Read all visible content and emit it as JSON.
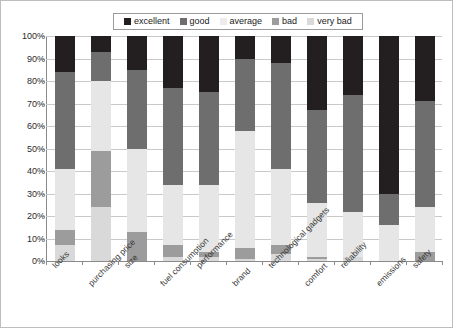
{
  "chart_data": {
    "type": "bar",
    "subtype": "stacked-bar-100-percent",
    "title": "",
    "xlabel": "",
    "ylabel": "",
    "ylim": [
      0,
      100
    ],
    "ytick_labels": [
      "0%",
      "10%",
      "20%",
      "30%",
      "40%",
      "50%",
      "60%",
      "70%",
      "80%",
      "90%",
      "100%"
    ],
    "ytick_values": [
      0,
      10,
      20,
      30,
      40,
      50,
      60,
      70,
      80,
      90,
      100
    ],
    "grid": true,
    "legend_position": "top",
    "categories": [
      "looks",
      "purchasing price",
      "size",
      "fuel consumption",
      "performance",
      "brand",
      "technological gadgets",
      "comfort",
      "reliability",
      "emissions",
      "safety"
    ],
    "series": [
      {
        "name": "excellent",
        "color": "#231f20",
        "values": [
          16,
          7,
          15,
          23,
          25,
          10,
          12,
          33,
          26,
          70,
          29
        ]
      },
      {
        "name": "good",
        "color": "#6e6e6e",
        "values": [
          43,
          13,
          35,
          43,
          41,
          32,
          47,
          41,
          52,
          14,
          47
        ]
      },
      {
        "name": "average",
        "color": "#e6e6e6",
        "values": [
          27,
          31,
          37,
          27,
          30,
          52,
          34,
          24,
          20,
          16,
          20
        ]
      },
      {
        "name": "bad",
        "color": "#9c9c9c",
        "values": [
          7,
          25,
          13,
          5,
          2,
          5,
          4,
          1,
          0,
          0,
          4
        ]
      },
      {
        "name": "very bad",
        "color": "#d9d9d9",
        "values": [
          7,
          24,
          0,
          2,
          2,
          1,
          3,
          1,
          2,
          0,
          0
        ]
      }
    ],
    "stack_order_bottom_to_top": [
      "very bad",
      "bad",
      "average",
      "good",
      "excellent"
    ]
  },
  "legend": {
    "entries": [
      {
        "label": "excellent",
        "color": "#231f20"
      },
      {
        "label": "good",
        "color": "#6e6e6e"
      },
      {
        "label": "average",
        "color": "#ececec"
      },
      {
        "label": "bad",
        "color": "#9c9c9c"
      },
      {
        "label": "very bad",
        "color": "#d9d9d9"
      }
    ]
  }
}
